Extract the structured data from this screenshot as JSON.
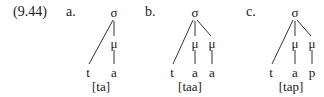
{
  "example_number": "(9.44)",
  "diagrams": [
    {
      "label": "a.",
      "root": "σ",
      "leaves": [
        "t",
        "a"
      ],
      "moras": [
        "μ"
      ],
      "transcription": "[ta]"
    },
    {
      "label": "b.",
      "root": "σ",
      "leaves": [
        "t",
        "a",
        "a"
      ],
      "moras": [
        "μ",
        "μ"
      ],
      "transcription": "[taa]"
    },
    {
      "label": "c.",
      "root": "σ",
      "leaves": [
        "t",
        "a",
        "p"
      ],
      "moras": [
        "μ",
        "μ"
      ],
      "transcription": "[tap]"
    }
  ]
}
